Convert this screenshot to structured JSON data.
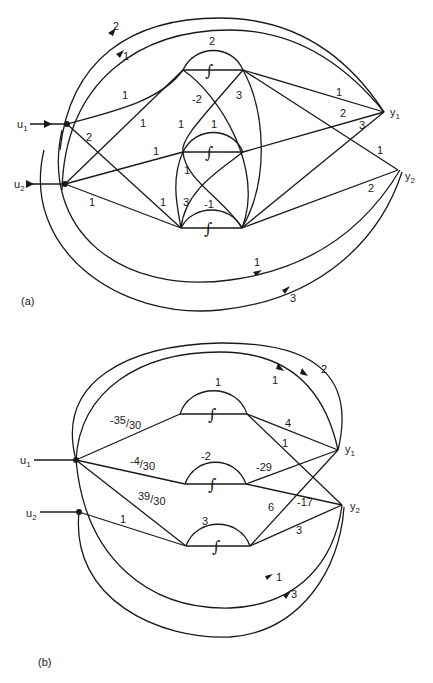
{
  "figure": {
    "panels": [
      {
        "id": "a",
        "label": "(a)",
        "inputs": [
          {
            "name": "u",
            "sub": "1"
          },
          {
            "name": "u",
            "sub": "2"
          }
        ],
        "outputs": [
          {
            "name": "y",
            "sub": "1"
          },
          {
            "name": "y",
            "sub": "2"
          }
        ],
        "integrator_symbol": "∫",
        "edge_labels": {
          "u1_y1_outer": "2",
          "u1_y1_inner": "1",
          "u1_int1": "1",
          "u1_int2": "2",
          "u1_int3_diag": "1",
          "u2_int2": "1",
          "u2_int3": "1",
          "int1_loop": "2",
          "int1_y1": "1",
          "int1_y2": "1",
          "int2_loop": "1",
          "int2_y1": "2",
          "int3_loop": "-1",
          "int3_y1": "3",
          "int3_y2": "2",
          "cross_m2": "-2",
          "cross_3a": "3",
          "cross_1a": "1",
          "cross_1b": "1",
          "cross_1c": "1",
          "cross_3b": "3",
          "u2_y2_inner": "1",
          "u2_y2_outer": "3"
        }
      },
      {
        "id": "b",
        "label": "(b)",
        "inputs": [
          {
            "name": "u",
            "sub": "1"
          },
          {
            "name": "u",
            "sub": "2"
          }
        ],
        "outputs": [
          {
            "name": "y",
            "sub": "1"
          },
          {
            "name": "y",
            "sub": "2"
          }
        ],
        "integrator_symbol": "∫",
        "edge_labels": {
          "u1_int1": {
            "num": "-35",
            "den": "30"
          },
          "u1_int2": {
            "num": "-4",
            "den": "30"
          },
          "u1_int3": {
            "num": "39",
            "den": "30"
          },
          "u2_int3": "1",
          "int1_loop": "1",
          "int2_loop": "-2",
          "int3_loop": "3",
          "int1_y1": "4",
          "int1_y2": "1",
          "int2_y1": "-29",
          "int2_y2": "-17",
          "int3_y1": "6",
          "int3_y2": "3",
          "u1_y1_inner": "1",
          "u1_y1_outer": "2",
          "u2_y2_inner": "1",
          "u2_y2_outer": "3"
        }
      }
    ]
  }
}
